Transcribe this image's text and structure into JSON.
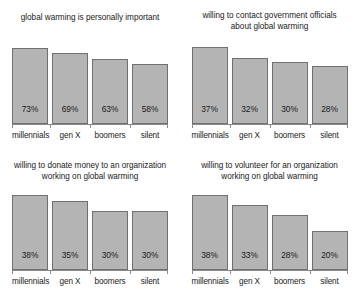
{
  "figure": {
    "categories": [
      "millennials",
      "gen X",
      "boomers",
      "silent"
    ],
    "colors": {
      "bar_fill": "#b4b4b4",
      "bar_border": "#707070",
      "text": "#1a1a1a",
      "axis": "#8a8a8a",
      "background": "#ffffff"
    }
  },
  "panels": [
    {
      "id": "personally-important",
      "title_line1": "global warming is personally important",
      "title_line2": "",
      "values": [
        73,
        69,
        63,
        58
      ],
      "labels": [
        "73%",
        "69%",
        "63%",
        "58%"
      ],
      "cat0": "millennials",
      "cat1": "gen X",
      "cat2": "boomers",
      "cat3": "silent"
    },
    {
      "id": "contact-government-officials",
      "title_line1": "willing to contact government officials",
      "title_line2": "about global warming",
      "values": [
        37,
        32,
        30,
        28
      ],
      "labels": [
        "37%",
        "32%",
        "30%",
        "28%"
      ],
      "cat0": "millennials",
      "cat1": "gen X",
      "cat2": "boomers",
      "cat3": "silent"
    },
    {
      "id": "donate-money",
      "title_line1": "willing to donate money to an organization",
      "title_line2": "working on global warming",
      "values": [
        38,
        35,
        30,
        30
      ],
      "labels": [
        "38%",
        "35%",
        "30%",
        "30%"
      ],
      "cat0": "millennials",
      "cat1": "gen X",
      "cat2": "boomers",
      "cat3": "silent"
    },
    {
      "id": "volunteer",
      "title_line1": "willing to volunteer for an organization",
      "title_line2": "working on global warming",
      "values": [
        38,
        33,
        28,
        20
      ],
      "labels": [
        "38%",
        "33%",
        "28%",
        "20%"
      ],
      "cat0": "millennials",
      "cat1": "gen X",
      "cat2": "boomers",
      "cat3": "silent"
    }
  ],
  "chart_data": [
    {
      "type": "bar",
      "title": "global warming is personally important",
      "categories": [
        "millennials",
        "gen X",
        "boomers",
        "silent"
      ],
      "values": [
        73,
        69,
        63,
        58
      ],
      "data_labels": [
        "73%",
        "69%",
        "63%",
        "58%"
      ],
      "xlabel": "",
      "ylabel": "",
      "ylim": [
        0,
        80
      ],
      "grid": false,
      "legend": "none",
      "units": "percent"
    },
    {
      "type": "bar",
      "title": "willing to contact government officials about global warming",
      "categories": [
        "millennials",
        "gen X",
        "boomers",
        "silent"
      ],
      "values": [
        37,
        32,
        30,
        28
      ],
      "data_labels": [
        "37%",
        "32%",
        "30%",
        "28%"
      ],
      "xlabel": "",
      "ylabel": "",
      "ylim": [
        0,
        40
      ],
      "grid": false,
      "legend": "none",
      "units": "percent"
    },
    {
      "type": "bar",
      "title": "willing to donate money to an organization working on global warming",
      "categories": [
        "millennials",
        "gen X",
        "boomers",
        "silent"
      ],
      "values": [
        38,
        35,
        30,
        30
      ],
      "data_labels": [
        "38%",
        "35%",
        "30%",
        "30%"
      ],
      "xlabel": "",
      "ylabel": "",
      "ylim": [
        0,
        40
      ],
      "grid": false,
      "legend": "none",
      "units": "percent"
    },
    {
      "type": "bar",
      "title": "willing to volunteer for an organization working on global warming",
      "categories": [
        "millennials",
        "gen X",
        "boomers",
        "silent"
      ],
      "values": [
        38,
        33,
        28,
        20
      ],
      "data_labels": [
        "38%",
        "33%",
        "28%",
        "20%"
      ],
      "xlabel": "",
      "ylabel": "",
      "ylim": [
        0,
        40
      ],
      "grid": false,
      "legend": "none",
      "units": "percent"
    }
  ]
}
